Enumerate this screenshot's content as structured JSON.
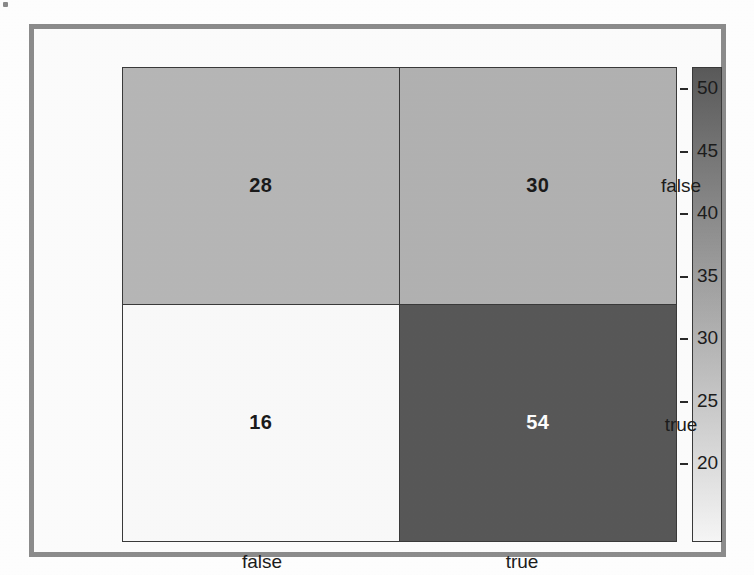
{
  "chart_data": {
    "type": "heatmap",
    "title": "",
    "xlabel": "",
    "ylabel": "",
    "x_categories": [
      "false",
      "true"
    ],
    "y_categories": [
      "false",
      "true"
    ],
    "values": [
      [
        28,
        30
      ],
      [
        16,
        54
      ]
    ],
    "cells": [
      {
        "row": "false",
        "col": "false",
        "value": "28",
        "fill": "#b7b7b7",
        "text_color": "#1a1a1a"
      },
      {
        "row": "false",
        "col": "true",
        "value": "30",
        "fill": "#b2b2b2",
        "text_color": "#1a1a1a"
      },
      {
        "row": "true",
        "col": "false",
        "value": "16",
        "fill": "#fafafa",
        "text_color": "#1a1a1a"
      },
      {
        "row": "true",
        "col": "true",
        "value": "54",
        "fill": "#585858",
        "text_color": "#ffffff"
      }
    ],
    "grid": false,
    "legend_position": "right",
    "colorbar": {
      "orientation": "vertical",
      "min": 16,
      "max": 54,
      "ticks": [
        "50",
        "45",
        "40",
        "35",
        "30",
        "25",
        "20"
      ],
      "tick_values": [
        50,
        45,
        40,
        35,
        30,
        25,
        20
      ],
      "top_color": "#5a5a5a",
      "bottom_color": "#f7f7f7"
    }
  },
  "axes": {
    "y_ticks": [
      {
        "label": "false"
      },
      {
        "label": "true"
      }
    ],
    "x_ticks": [
      {
        "label": "false"
      },
      {
        "label": "true"
      }
    ]
  },
  "frame": {
    "border_color": "#8c8c8c",
    "background": "#fdfdfd"
  },
  "bleed_through": {
    "lines": [
      "not to have next check",
      "this. Note this value",
      "has each be included in",
      "these. Through other that",
      "but this)."
    ]
  }
}
